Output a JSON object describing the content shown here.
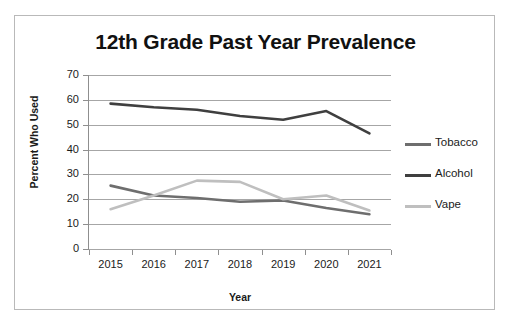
{
  "chart_data": {
    "type": "line",
    "title": "12th Grade Past Year Prevalence",
    "xlabel": "Year",
    "ylabel": "Percent Who Used",
    "categories": [
      "2015",
      "2016",
      "2017",
      "2018",
      "2019",
      "2020",
      "2021"
    ],
    "ylim": [
      0,
      70
    ],
    "yticks": [
      "70",
      "60",
      "50",
      "40",
      "30",
      "20",
      "10",
      "0"
    ],
    "ytick_values": [
      70,
      60,
      50,
      40,
      30,
      20,
      10,
      0
    ],
    "grid": "horizontal",
    "legend_position": "right",
    "series": [
      {
        "name": "Tobacco",
        "color": "#6e6e6e",
        "values": [
          25.5,
          21.5,
          20.5,
          19.0,
          19.5,
          16.5,
          14.0
        ]
      },
      {
        "name": "Alcohol",
        "color": "#3f3f3f",
        "values": [
          58.5,
          57.0,
          56.0,
          53.5,
          52.0,
          55.5,
          46.5
        ]
      },
      {
        "name": "Vape",
        "color": "#bfbfbf",
        "values": [
          16.0,
          21.5,
          27.5,
          27.0,
          20.0,
          21.5,
          15.5
        ]
      }
    ]
  },
  "colors": {
    "background": "#ffffff",
    "border": "#b9b9b9",
    "gridline": "#a6a6a6",
    "axis": "#8f8f8f",
    "text": "#1a1a1a",
    "tobacco": "#6e6e6e",
    "alcohol": "#3f3f3f",
    "vape": "#bfbfbf"
  }
}
